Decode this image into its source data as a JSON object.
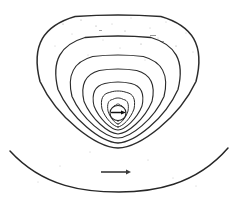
{
  "figure": {
    "title": "Dipole magnetic field lines above a curved surface",
    "background_color": "#ffffff",
    "ink_color": "#2b2b2b",
    "width": 237,
    "height": 211,
    "source_appearance": "photocopied line drawing with scanning specks"
  },
  "source": {
    "center_label": "",
    "scale_label": "",
    "arrow_label": ""
  },
  "chart_data": {
    "type": "line",
    "title": "Dipole magnetic field lines above a curved surface",
    "subtitle": "",
    "xlabel": "",
    "ylabel": "",
    "xlim": [
      0,
      237
    ],
    "ylim": [
      0,
      211
    ],
    "grid": false,
    "legend": "none",
    "annotations": [
      {
        "name": "dipole-marker",
        "kind": "circle-with-arrow",
        "x": 118,
        "y": 113,
        "radius": 7.5,
        "arrow_direction": "right",
        "arrow_length": 13
      },
      {
        "name": "scale-arrow",
        "kind": "horizontal-arrow",
        "x1": 101,
        "y1": 172,
        "x2": 131,
        "y2": 172,
        "arrow_direction": "right"
      }
    ],
    "series": [
      {
        "name": "field-line-1",
        "role": "innermost-loop",
        "center_x": 118,
        "top_y": 104,
        "half_width": 5,
        "cusp_y": 121
      },
      {
        "name": "field-line-2",
        "role": "loop",
        "center_x": 118,
        "top_y": 98,
        "half_width": 10,
        "cusp_y": 124
      },
      {
        "name": "field-line-3",
        "role": "loop",
        "center_x": 118,
        "top_y": 91,
        "half_width": 16,
        "cusp_y": 127
      },
      {
        "name": "field-line-4",
        "role": "loop",
        "center_x": 118,
        "top_y": 82,
        "half_width": 24,
        "cusp_y": 130
      },
      {
        "name": "field-line-5",
        "role": "loop",
        "center_x": 118,
        "top_y": 69,
        "half_width": 34,
        "cusp_y": 134
      },
      {
        "name": "field-line-6",
        "role": "loop",
        "center_x": 118,
        "top_y": 55,
        "half_width": 46,
        "cusp_y": 138
      },
      {
        "name": "field-line-7",
        "role": "loop",
        "center_x": 118,
        "top_y": 36,
        "half_width": 60,
        "cusp_y": 143
      },
      {
        "name": "field-line-8",
        "role": "outermost-loop",
        "center_x": 118,
        "top_y": 15,
        "half_width": 78,
        "cusp_y": 148
      },
      {
        "name": "ground-arc",
        "role": "boundary-surface",
        "x_start": 10,
        "y_start": 151,
        "x_mid": 119,
        "y_mid": 192,
        "x_end": 228,
        "y_end": 148
      }
    ]
  }
}
